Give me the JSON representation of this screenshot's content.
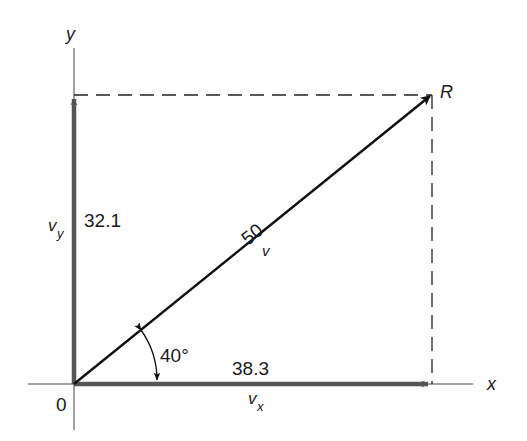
{
  "diagram": {
    "type": "vector-resolution",
    "colors": {
      "background": "#ffffff",
      "ink": "#111111",
      "component_vectors": "#555555",
      "dashed": "#222222"
    },
    "axes": {
      "x_label": "x",
      "y_label": "y",
      "origin_label": "0"
    },
    "resultant": {
      "endpoint_label": "R",
      "magnitude_label": "50",
      "name_label": "v"
    },
    "components": {
      "x": {
        "value_label": "38.3",
        "name": "v",
        "subscript": "x"
      },
      "y": {
        "value_label": "32.1",
        "name": "v",
        "subscript": "y"
      }
    },
    "angle": {
      "label": "40°"
    }
  }
}
